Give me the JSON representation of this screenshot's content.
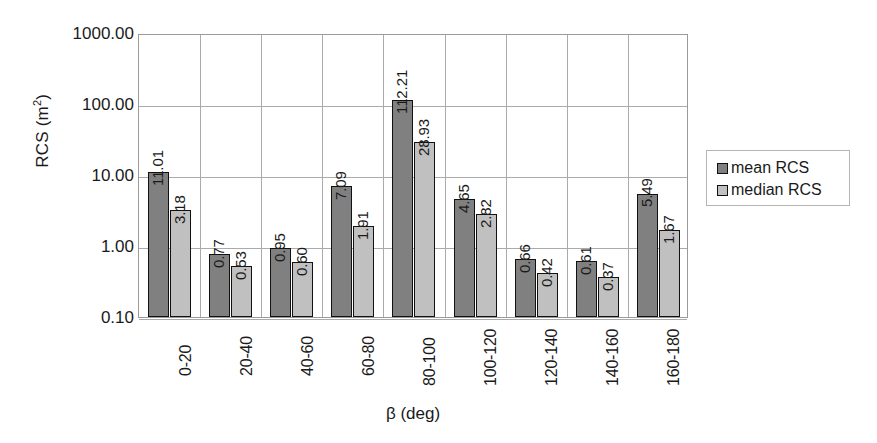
{
  "chart_data": {
    "type": "bar",
    "title": "",
    "xlabel": "β (deg)",
    "ylabel": "RCS (m²)",
    "ylabel_base": "RCS (m",
    "ylabel_sup": "2",
    "ylabel_tail": ")",
    "yscale": "log",
    "ylim": [
      0.1,
      1000.0
    ],
    "grid": true,
    "legend_position": "right",
    "categories": [
      "0-20",
      "20-40",
      "40-60",
      "60-80",
      "80-100",
      "100-120",
      "120-140",
      "140-160",
      "160-180"
    ],
    "ytick_labels": [
      "1000.00",
      "100.00",
      "10.00",
      "1.00",
      "0.10"
    ],
    "ytick_values": [
      1000,
      100,
      10,
      1,
      0.1
    ],
    "series": [
      {
        "name": "mean RCS",
        "color": "#808080",
        "values": [
          11.01,
          0.77,
          0.95,
          7.09,
          112.21,
          4.65,
          0.66,
          0.61,
          5.49
        ],
        "labels": [
          "11.01",
          "0.77",
          "0.95",
          "7.09",
          "112.21",
          "4.65",
          "0.66",
          "0.61",
          "5.49"
        ]
      },
      {
        "name": "median RCS",
        "color": "#c0c0c0",
        "values": [
          3.18,
          0.53,
          0.6,
          1.91,
          28.93,
          2.82,
          0.42,
          0.37,
          1.67
        ],
        "labels": [
          "3.18",
          "0.53",
          "0.60",
          "1.91",
          "28.93",
          "2.82",
          "0.42",
          "0.37",
          "1.67"
        ]
      }
    ]
  },
  "legend": {
    "items": [
      {
        "label": "mean RCS",
        "color": "#808080"
      },
      {
        "label": "median RCS",
        "color": "#c0c0c0"
      }
    ]
  }
}
